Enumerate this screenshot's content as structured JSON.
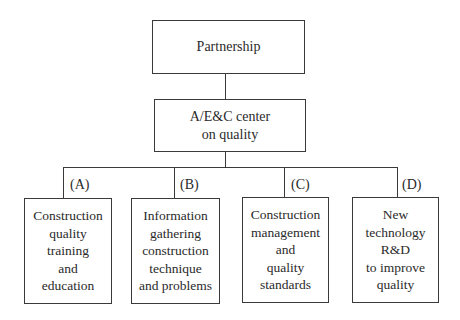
{
  "diagram": {
    "type": "org-chart",
    "root": {
      "label": "Partnership"
    },
    "center": {
      "label": "A/E&C center\non quality"
    },
    "branches": [
      {
        "tag": "(A)",
        "label": "Construction\nquality\ntraining\nand\neducation"
      },
      {
        "tag": "(B)",
        "label": "Information\ngathering\nconstruction\ntechnique\nand problems"
      },
      {
        "tag": "(C)",
        "label": "Construction\nmanagement\nand\nquality\nstandards"
      },
      {
        "tag": "(D)",
        "label": "New\ntechnology\nR&D\nto improve\nquality"
      }
    ],
    "edges": [
      [
        "Partnership",
        "A/E&C center on quality"
      ],
      [
        "A/E&C center on quality",
        "(A)"
      ],
      [
        "A/E&C center on quality",
        "(B)"
      ],
      [
        "A/E&C center on quality",
        "(C)"
      ],
      [
        "A/E&C center on quality",
        "(D)"
      ]
    ]
  }
}
